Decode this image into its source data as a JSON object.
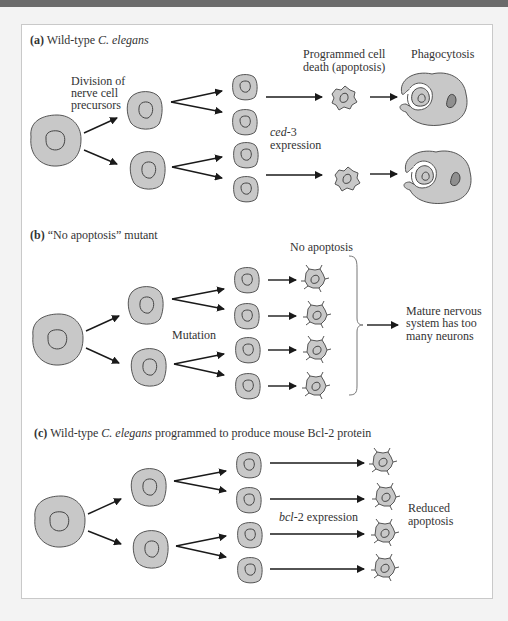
{
  "figure": {
    "panels": [
      {
        "id": "a",
        "letter": "(a)",
        "title_plain": "Wild-type ",
        "title_italic": "C. elegans",
        "title_rest": "",
        "labels": {
          "division": [
            "Division of",
            "nerve cell",
            "precursors"
          ],
          "programmed_death": [
            "Programmed cell",
            "death (apoptosis)"
          ],
          "phagocytosis": "Phagocytosis",
          "gene_italic": "ced",
          "gene_rest": "-3",
          "expression": "expression"
        }
      },
      {
        "id": "b",
        "letter": "(b)",
        "title_plain": "“No apoptosis” mutant",
        "labels": {
          "no_apoptosis": "No apoptosis",
          "mutation": "Mutation",
          "outcome": [
            "Mature nervous",
            "system has too",
            "many neurons"
          ]
        }
      },
      {
        "id": "c",
        "letter": "(c)",
        "title_plain": "Wild-type ",
        "title_italic": "C. elegans",
        "title_rest": " programmed to produce mouse Bcl-2 protein",
        "labels": {
          "gene_italic": "bcl",
          "gene_rest": "-2 expression",
          "outcome": [
            "Reduced",
            "apoptosis"
          ]
        }
      }
    ],
    "colors": {
      "cell_fill": "#c8c8c8",
      "cell_stroke": "#555555",
      "dark_nucleus": "#8f8f8f",
      "frame_border": "#c9c9c9",
      "top_bar": "#6b6b6b",
      "page_bg": "#f3f3f3"
    }
  }
}
